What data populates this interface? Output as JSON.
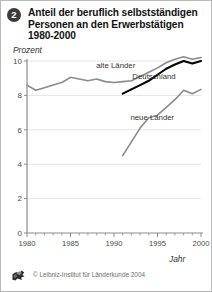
{
  "header": {
    "badge_number": "2",
    "title": "Anteil der beruflich selbstständigen Personen an den Erwerbstätigen 1980-2000"
  },
  "footer": {
    "copyright": "© Leibniz-Institut für Länderkunde 2004",
    "logo_name": "leibniz-institut-logo"
  },
  "colors": {
    "grid": "#d9d9d9",
    "axis": "#8c8c8c",
    "alte_laender": "#8a8a8a",
    "neue_laender": "#8a8a8a",
    "deutschland": "#000000",
    "badge": "#3b3b3b"
  },
  "chart_data": {
    "type": "line",
    "title": "Anteil der beruflich selbstständigen Personen an den Erwerbstätigen 1980-2000",
    "xlabel": "Jahr",
    "ylabel": "Prozent",
    "xlim": [
      1980,
      2000
    ],
    "ylim": [
      0,
      10
    ],
    "grid": true,
    "legend_position": "inline-annotations",
    "y_ticks": [
      0,
      2,
      4,
      6,
      8,
      10
    ],
    "y_tick_labels": [
      "0",
      "2",
      "4",
      "6",
      "8",
      "10"
    ],
    "x_ticks_major": [
      1980,
      1985,
      1990,
      1995,
      2000
    ],
    "x_tick_labels": [
      "1980",
      "1985",
      "1990",
      "1995",
      "2000"
    ],
    "x_minor_tick_step": 1,
    "series": [
      {
        "name": "alte Länder",
        "color": "#8a8a8a",
        "width": 1.6,
        "label_x": 1990.2,
        "label_y": 9.62,
        "x": [
          1980,
          1981,
          1982,
          1983,
          1984,
          1985,
          1986,
          1987,
          1988,
          1989,
          1990,
          1991,
          1992,
          1993,
          1994,
          1995,
          1996,
          1997,
          1998,
          1999,
          2000
        ],
        "values": [
          8.6,
          8.3,
          8.45,
          8.6,
          8.75,
          9.05,
          8.95,
          8.85,
          8.95,
          8.8,
          8.75,
          8.8,
          8.85,
          9.1,
          9.35,
          9.6,
          9.9,
          10.1,
          10.25,
          10.1,
          10.2
        ]
      },
      {
        "name": "Deutschland",
        "color": "#000000",
        "width": 2.1,
        "label_x": 1994.6,
        "label_y": 8.95,
        "x": [
          1991,
          1992,
          1993,
          1994,
          1995,
          1996,
          1997,
          1998,
          1999,
          2000
        ],
        "values": [
          8.1,
          8.35,
          8.6,
          8.85,
          9.2,
          9.55,
          9.8,
          10.0,
          9.85,
          10.0
        ]
      },
      {
        "name": "neue Länder",
        "color": "#8a8a8a",
        "width": 1.6,
        "label_x": 1994.4,
        "label_y": 6.55,
        "x": [
          1991,
          1992,
          1993,
          1994,
          1995,
          1996,
          1997,
          1998,
          1999,
          2000
        ],
        "values": [
          4.5,
          5.3,
          6.1,
          6.7,
          6.85,
          7.3,
          7.75,
          8.3,
          8.1,
          8.35
        ]
      }
    ]
  }
}
